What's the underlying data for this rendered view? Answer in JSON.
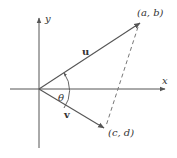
{
  "diagram": {
    "type": "vector-angle",
    "axes": {
      "x_label": "x",
      "y_label": "y"
    },
    "vectors": [
      {
        "name": "u",
        "endpoint_label": "(a, b)"
      },
      {
        "name": "v",
        "endpoint_label": "(c, d)"
      }
    ],
    "angle_label": "θ",
    "dashed_segment": "u - v (from (c, d) to (a, b))",
    "colors": {
      "stroke": "#555555",
      "text": "#333333"
    }
  }
}
